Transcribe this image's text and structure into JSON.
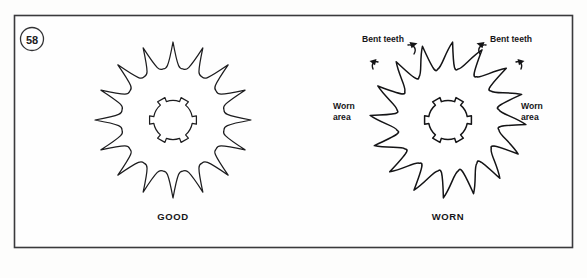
{
  "figure": {
    "number": "58",
    "background_color": "#fdfdfc",
    "frame_color": "#3a3a3c",
    "ink_color": "#1d1d1f"
  },
  "panels": [
    {
      "id": "good-sprocket",
      "caption": "GOOD",
      "tooth_count": 16,
      "hub_spline_count": 6,
      "condition": "good"
    },
    {
      "id": "worn-sprocket",
      "caption": "WORN",
      "tooth_count": 16,
      "hub_spline_count": 6,
      "condition": "worn"
    }
  ],
  "callouts": [
    {
      "id": "bent-teeth-left",
      "label": "Bent teeth"
    },
    {
      "id": "bent-teeth-right",
      "label": "Bent teeth"
    },
    {
      "id": "worn-area-left",
      "line1": "Worn",
      "line2": "area"
    },
    {
      "id": "worn-area-right",
      "line1": "Worn",
      "line2": "area"
    }
  ]
}
